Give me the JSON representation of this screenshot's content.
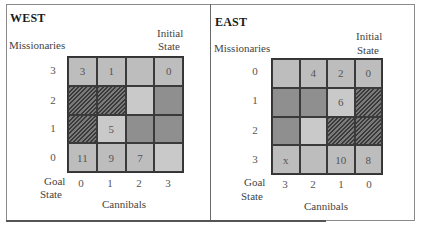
{
  "west": {
    "title": "WEST",
    "y_axis_label": "Missionaries",
    "x_axis_label": "Cannibals",
    "initial_state_label_1": "Initial",
    "initial_state_label_2": "State",
    "goal_state_label_1": "Goal",
    "goal_state_label_2": "State",
    "row_labels": [
      "3",
      "2",
      "1",
      "0"
    ],
    "col_labels": [
      "0",
      "1",
      "2",
      "3"
    ],
    "cells": [
      [
        {
          "text": "3",
          "shade": "mid"
        },
        {
          "text": "1",
          "shade": "mid"
        },
        {
          "text": "",
          "shade": "mid"
        },
        {
          "text": "0",
          "shade": "mid"
        }
      ],
      [
        {
          "text": "",
          "shade": "hatch"
        },
        {
          "text": "",
          "shade": "hatch"
        },
        {
          "text": "",
          "shade": "light"
        },
        {
          "text": "",
          "shade": "dark"
        }
      ],
      [
        {
          "text": "",
          "shade": "hatch"
        },
        {
          "text": "5",
          "shade": "light"
        },
        {
          "text": "",
          "shade": "dark"
        },
        {
          "text": "",
          "shade": "dark"
        }
      ],
      [
        {
          "text": "11",
          "shade": "mid"
        },
        {
          "text": "9",
          "shade": "mid"
        },
        {
          "text": "7",
          "shade": "mid"
        },
        {
          "text": "",
          "shade": "light"
        }
      ]
    ]
  },
  "east": {
    "title": "EAST",
    "y_axis_label": "Missionaries",
    "x_axis_label": "Cannibals",
    "initial_state_label_1": "Initial",
    "initial_state_label_2": "State",
    "goal_state_label_1": "Goal",
    "goal_state_label_2": "State",
    "row_labels": [
      "0",
      "1",
      "2",
      "3"
    ],
    "col_labels": [
      "3",
      "2",
      "1",
      "0"
    ],
    "cells": [
      [
        {
          "text": "",
          "shade": "mid"
        },
        {
          "text": "4",
          "shade": "mid"
        },
        {
          "text": "2",
          "shade": "mid"
        },
        {
          "text": "0",
          "shade": "mid"
        }
      ],
      [
        {
          "text": "",
          "shade": "dark"
        },
        {
          "text": "",
          "shade": "dark"
        },
        {
          "text": "6",
          "shade": "light"
        },
        {
          "text": "",
          "shade": "hatch"
        }
      ],
      [
        {
          "text": "",
          "shade": "dark"
        },
        {
          "text": "",
          "shade": "light"
        },
        {
          "text": "",
          "shade": "hatch"
        },
        {
          "text": "",
          "shade": "hatch"
        }
      ],
      [
        {
          "text": "x",
          "shade": "mid"
        },
        {
          "text": "",
          "shade": "mid"
        },
        {
          "text": "10",
          "shade": "mid"
        },
        {
          "text": "8",
          "shade": "mid"
        }
      ]
    ]
  }
}
